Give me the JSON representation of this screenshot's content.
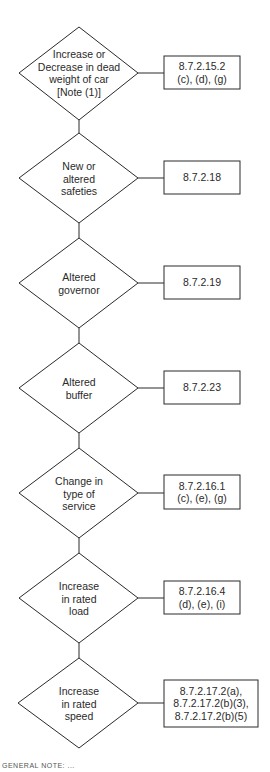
{
  "diagram": {
    "type": "flowchart",
    "colors": {
      "stroke": "#2a2a2a",
      "background": "#ffffff",
      "text": "#2a2a2a"
    },
    "nodes": [
      {
        "decision": "Increase or\nDecrease in dead\nweight of car\n[Note (1)]",
        "reference": "8.7.2.15.2\n(c), (d), (g)"
      },
      {
        "decision": "New or\naltered\nsafeties",
        "reference": "8.7.2.18"
      },
      {
        "decision": "Altered\ngovernor",
        "reference": "8.7.2.19"
      },
      {
        "decision": "Altered\nbuffer",
        "reference": "8.7.2.23"
      },
      {
        "decision": "Change in\ntype of\nservice",
        "reference": "8.7.2.16.1\n(c), (e), (g)"
      },
      {
        "decision": "Increase\nin rated\nload",
        "reference": "8.7.2.16.4\n(d), (e), (i)"
      },
      {
        "decision": "Increase\nin rated\nspeed",
        "reference": "8.7.2.17.2(a),\n8.7.2.17.2(b)(3),\n8.7.2.17.2(b)(5)"
      }
    ],
    "footer_fragment": "GENERAL NOTE: ..."
  }
}
